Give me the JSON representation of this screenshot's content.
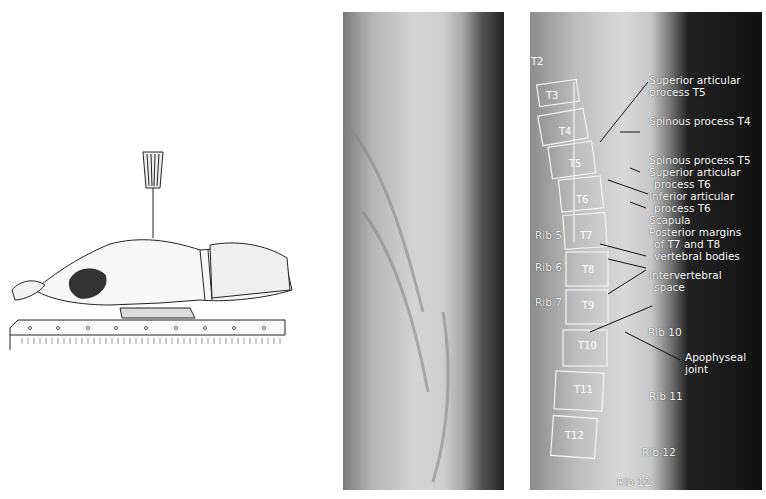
{
  "figure": {
    "panels": [
      "positioning-illustration",
      "lateral-thoracic-radiograph",
      "labeled-radiograph"
    ],
    "labels": {
      "vertebrae": [
        "T2",
        "T3",
        "T4",
        "T5",
        "T6",
        "T7",
        "T8",
        "T9",
        "T10",
        "T11",
        "T12"
      ],
      "ribs_left": [
        "Rib 5",
        "Rib 6",
        "Rib 7"
      ],
      "ribs_right": [
        "Rib 10",
        "Rib 11",
        "Rib 12",
        "Rib 12"
      ],
      "annotations": [
        "Superior articular process T5",
        "Spinous process T4",
        "Spinous process T5",
        "Superior articular process T6",
        "Inferior articular process T6",
        "Scapula",
        "Posterior margins of T7 and T8 vertebral bodies",
        "Intervertebral space",
        "Apophyseal joint"
      ]
    },
    "text": {
      "sup_art_t5_l1": "Superior articular",
      "sup_art_t5_l2": "process T5",
      "spin_t4": "Spinous process T4",
      "spin_t5": "Spinous process T5",
      "sup_art_t6_l1": "Superior articular",
      "sup_art_t6_l2": "process T6",
      "inf_art_t6_l1": "Inferior articular",
      "inf_art_t6_l2": "process T6",
      "scapula": "Scapula",
      "post_l1": "Posterior margins",
      "post_l2": "of T7 and T8",
      "post_l3": "vertebral bodies",
      "iv_l1": "Intervertebral",
      "iv_l2": "space",
      "apo_l1": "Apophyseal",
      "apo_l2": "joint",
      "rib5": "Rib 5",
      "rib6": "Rib 6",
      "rib7": "Rib 7",
      "rib10": "Rib 10",
      "rib11": "Rib 11",
      "rib12a": "Rib 12",
      "rib12b": "Rib 12",
      "t2": "T2",
      "t3": "T3",
      "t4": "T4",
      "t5": "T5",
      "t6": "T6",
      "t7": "T7",
      "t8": "T8",
      "t9": "T9",
      "t10": "T10",
      "t11": "T11",
      "t12": "T12"
    }
  }
}
